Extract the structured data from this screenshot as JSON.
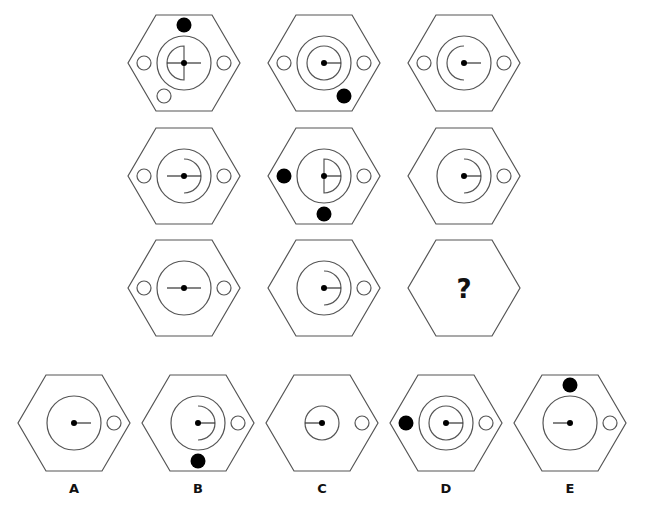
{
  "puzzle": {
    "type": "3x3 matrix reasoning",
    "stroke_color": "#555555",
    "fill_color": "#000000",
    "question_mark": "?",
    "grid": [
      {
        "row": 1,
        "col": 1,
        "cx": 184,
        "cy": 63,
        "outer_circle": true,
        "inner_circle": false,
        "half_disc": "left",
        "arc": "none",
        "line_left": true,
        "line_right": true,
        "side_circles": [
          "left",
          "right"
        ],
        "bottom_left_circle": true,
        "black_dots": [
          "top"
        ]
      },
      {
        "row": 1,
        "col": 2,
        "cx": 324,
        "cy": 63,
        "outer_circle": true,
        "inner_circle": true,
        "half_disc": "none",
        "arc": "none",
        "line_left": false,
        "line_right": true,
        "side_circles": [
          "left",
          "right"
        ],
        "bottom_left_circle": false,
        "black_dots": [
          "bottom-right"
        ]
      },
      {
        "row": 1,
        "col": 3,
        "cx": 464,
        "cy": 63,
        "outer_circle": true,
        "inner_circle": false,
        "half_disc": "none",
        "arc": "left",
        "line_left": false,
        "line_right": true,
        "side_circles": [
          "left",
          "right"
        ],
        "bottom_left_circle": false,
        "black_dots": []
      },
      {
        "row": 2,
        "col": 1,
        "cx": 184,
        "cy": 176,
        "outer_circle": true,
        "inner_circle": false,
        "half_disc": "none",
        "arc": "right",
        "line_left": true,
        "line_right": true,
        "side_circles": [
          "left",
          "right"
        ],
        "bottom_left_circle": false,
        "black_dots": []
      },
      {
        "row": 2,
        "col": 2,
        "cx": 324,
        "cy": 176,
        "outer_circle": true,
        "inner_circle": false,
        "half_disc": "right",
        "arc": "none",
        "line_left": false,
        "line_right": true,
        "side_circles": [
          "right"
        ],
        "bottom_left_circle": false,
        "black_dots": [
          "left",
          "bottom"
        ]
      },
      {
        "row": 2,
        "col": 3,
        "cx": 464,
        "cy": 176,
        "outer_circle": true,
        "inner_circle": false,
        "half_disc": "none",
        "arc": "right",
        "line_left": false,
        "line_right": true,
        "side_circles": [
          "right"
        ],
        "bottom_left_circle": false,
        "black_dots": []
      },
      {
        "row": 3,
        "col": 1,
        "cx": 184,
        "cy": 288,
        "outer_circle": true,
        "inner_circle": false,
        "half_disc": "none",
        "arc": "none",
        "line_left": true,
        "line_right": true,
        "side_circles": [
          "left",
          "right"
        ],
        "bottom_left_circle": false,
        "black_dots": []
      },
      {
        "row": 3,
        "col": 2,
        "cx": 324,
        "cy": 288,
        "outer_circle": true,
        "inner_circle": false,
        "half_disc": "none",
        "arc": "right",
        "line_left": false,
        "line_right": true,
        "side_circles": [
          "right"
        ],
        "bottom_left_circle": false,
        "black_dots": []
      },
      {
        "row": 3,
        "col": 3,
        "cx": 464,
        "cy": 288,
        "question": true
      }
    ],
    "options": [
      {
        "label": "A",
        "cx": 74,
        "cy": 423,
        "outer_circle": true,
        "outer_r": 27,
        "inner_circle": false,
        "half_disc": "none",
        "arc": "none",
        "line_left": false,
        "line_right": true,
        "side_circles": [
          "right"
        ],
        "black_dots": []
      },
      {
        "label": "B",
        "cx": 198,
        "cy": 423,
        "outer_circle": true,
        "outer_r": 27,
        "inner_circle": false,
        "half_disc": "none",
        "arc": "right",
        "line_left": false,
        "line_right": true,
        "side_circles": [
          "right"
        ],
        "black_dots": [
          "bottom"
        ]
      },
      {
        "label": "C",
        "cx": 322,
        "cy": 423,
        "outer_circle": true,
        "outer_r": 17,
        "inner_circle": false,
        "half_disc": "none",
        "arc": "none",
        "line_left": true,
        "line_right": false,
        "side_circles": [
          "right"
        ],
        "black_dots": []
      },
      {
        "label": "D",
        "cx": 446,
        "cy": 423,
        "outer_circle": true,
        "outer_r": 27,
        "inner_circle": true,
        "half_disc": "none",
        "arc": "none",
        "line_left": false,
        "line_right": true,
        "side_circles": [
          "right"
        ],
        "black_dots": [
          "left"
        ]
      },
      {
        "label": "E",
        "cx": 570,
        "cy": 423,
        "outer_circle": true,
        "outer_r": 27,
        "inner_circle": false,
        "half_disc": "none",
        "arc": "none",
        "line_left": true,
        "line_right": false,
        "side_circles": [
          "right"
        ],
        "black_dots": [
          "top"
        ]
      }
    ]
  }
}
